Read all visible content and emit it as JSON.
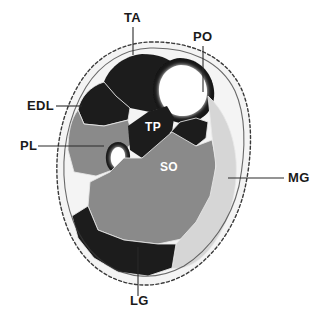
{
  "figure": {
    "kind": "anatomical-cross-section",
    "background_color": "#ffffff",
    "canvas": {
      "width": 318,
      "height": 319
    }
  },
  "palette": {
    "dark_muscle": "#1d1d1d",
    "mid_muscle": "#8a8a8a",
    "light_muscle": "#d6d6d6",
    "bone_marrow": "#ffffff",
    "bone_cortex": "#151515",
    "subcutaneous": "#f4f4f4",
    "skin_outline": "#3a3a3a",
    "septum": "#e8e8e8",
    "label_text": "#1a1a1a",
    "label_text_inverse": "#ffffff",
    "leader_line": "#2a2a2a"
  },
  "external_labels": [
    {
      "id": "TA",
      "text": "TA",
      "meaning": "tibialis-anterior",
      "text_x": 124,
      "text_y": 22,
      "anchor": "start",
      "leader": "M 133 27 L 133 55"
    },
    {
      "id": "PO",
      "text": "PO",
      "meaning": "popliteus",
      "text_x": 193,
      "text_y": 41,
      "anchor": "start",
      "leader": "M 203 46 L 203 92"
    },
    {
      "id": "EDL",
      "text": "EDL",
      "meaning": "extensor-digitorum-longus",
      "text_x": 27,
      "text_y": 110,
      "anchor": "start",
      "leader": "M 56 106 L 82 106"
    },
    {
      "id": "PL",
      "text": "PL",
      "meaning": "peroneus-longus",
      "text_x": 20,
      "text_y": 150,
      "anchor": "start",
      "leader": "M 38 146 L 104 146"
    },
    {
      "id": "MG",
      "text": "MG",
      "meaning": "medial-gastrocnemius",
      "text_x": 288,
      "text_y": 182,
      "anchor": "start",
      "leader": "M 228 178 L 284 178"
    },
    {
      "id": "LG",
      "text": "LG",
      "meaning": "lateral-gastrocnemius",
      "text_x": 130,
      "text_y": 305,
      "anchor": "start",
      "leader": "M 138 296 L 138 247"
    }
  ],
  "internal_labels": [
    {
      "id": "TP",
      "text": "TP",
      "meaning": "tibialis-posterior",
      "text_x": 145,
      "text_y": 131,
      "color": "#ffffff"
    },
    {
      "id": "SO",
      "text": "SO",
      "meaning": "soleus",
      "text_x": 160,
      "text_y": 171,
      "color": "#ffffff"
    }
  ],
  "regions": [
    {
      "id": "subcutaneous-fat",
      "name": "subcutaneous-fat-layer",
      "fill": "#f4f4f4",
      "path": "M 150 42 C 192 41 226 57 241 88 C 254 116 252 156 245 188 C 237 224 216 256 186 274 C 158 290 126 288 102 272 C 76 255 62 224 58 190 C 54 154 60 114 81 81 C 97 56 122 43 150 42 Z"
    },
    {
      "id": "deep-fascia",
      "name": "deep-fascia-boundary",
      "fill": "none",
      "path": "M 150 48 C 190 47 221 62 235 91 C 247 118 245 155 239 186 C 231 219 211 249 184 266 C 157 281 128 279 106 264 C 82 248 69 219 65 188 C 61 155 67 118 86 87 C 101 63 124 49 150 48 Z"
    },
    {
      "id": "tibialis-anterior",
      "name": "region-tibialis-anterior",
      "fill": "#1d1d1d",
      "path": "M 142 54 C 158 54 169 58 176 66 L 172 84 L 167 106 L 150 112 L 130 108 L 116 96 L 104 82 C 108 70 122 56 142 54 Z"
    },
    {
      "id": "extensor-digitorum-longus",
      "name": "region-extensor-digitorum-longus",
      "fill": "#1d1d1d",
      "path": "M 104 82 L 116 96 L 130 108 L 128 120 L 104 126 L 84 124 L 78 110 C 80 98 90 86 104 82 Z"
    },
    {
      "id": "peroneus-longus",
      "name": "region-peroneus-longus",
      "fill": "#8a8a8a",
      "path": "M 78 110 L 84 124 L 104 126 L 128 120 L 134 140 L 124 152 L 118 168 L 96 176 L 74 172 L 68 150 C 68 132 71 119 78 110 Z"
    },
    {
      "id": "tibia-cortex",
      "name": "bone-tibia-cortex",
      "fill": "#151515",
      "path": "M 180 58 C 198 58 212 72 214 90 C 216 108 204 122 186 123 C 168 124 154 110 153 92 C 152 73 164 59 180 58 Z"
    },
    {
      "id": "tibia-marrow",
      "name": "bone-tibia-marrow",
      "fill": "#ffffff",
      "path": "M 181 65 C 195 65 206 76 207 90 C 208 104 198 115 184 116 C 170 117 160 106 159 92 C 158 77 168 66 181 65 Z"
    },
    {
      "id": "fibula-cortex",
      "name": "bone-fibula-cortex",
      "fill": "#151515",
      "path": "M 118 142 C 126 142 131 150 130 159 C 129 168 123 174 116 173 C 109 172 105 164 106 155 C 107 147 112 142 118 142 Z"
    },
    {
      "id": "fibula-marrow",
      "name": "bone-fibula-marrow",
      "fill": "#ffffff",
      "path": "M 118 147 C 123 147 126 152 125 159 C 124 165 121 169 117 168 C 112 167 110 161 111 155 C 112 150 115 147 118 147 Z"
    },
    {
      "id": "tibialis-posterior",
      "name": "region-tibialis-posterior",
      "fill": "#1d1d1d",
      "path": "M 148 112 L 167 106 L 174 118 L 172 132 L 160 146 L 142 158 L 130 150 L 128 126 Z"
    },
    {
      "id": "popliteus-deep-flexors",
      "name": "region-popliteus-deep-flexors",
      "fill": "#1d1d1d",
      "path": "M 180 122 L 196 118 L 208 122 L 206 138 L 196 146 L 176 144 L 170 133 Z"
    },
    {
      "id": "soleus",
      "name": "region-soleus",
      "fill": "#8a8a8a",
      "path": "M 172 132 L 196 146 L 212 140 L 216 160 L 214 190 L 202 218 L 186 238 L 158 244 L 124 240 L 98 230 L 88 206 L 90 182 L 110 172 L 124 158 L 142 158 Z"
    },
    {
      "id": "medial-gastrocnemius",
      "name": "region-medial-gastrocnemius",
      "fill": "#d6d6d6",
      "path": "M 208 96 C 224 110 234 134 236 160 C 238 190 230 222 212 246 C 200 262 186 270 172 268 L 176 244 L 196 222 L 210 196 L 216 166 L 212 136 Z"
    },
    {
      "id": "lateral-gastrocnemius",
      "name": "region-lateral-gastrocnemius",
      "fill": "#1d1d1d",
      "path": "M 88 206 L 98 230 L 124 240 L 158 244 L 176 244 L 172 268 L 148 276 L 118 272 L 94 258 L 78 238 L 72 216 Z"
    }
  ]
}
